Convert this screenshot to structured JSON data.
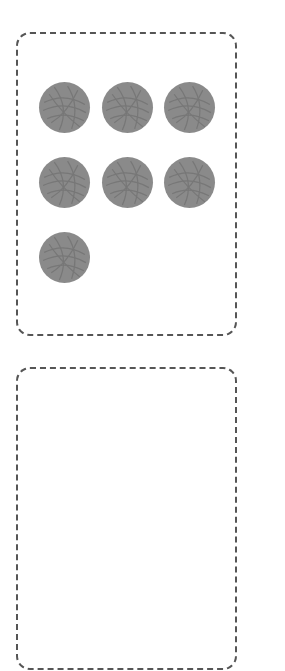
{
  "source_box": {
    "ball_count": 7,
    "balls": [
      {
        "x": 39,
        "y": 82
      },
      {
        "x": 102,
        "y": 82
      },
      {
        "x": 164,
        "y": 82
      },
      {
        "x": 39,
        "y": 157
      },
      {
        "x": 102,
        "y": 157
      },
      {
        "x": 164,
        "y": 157
      },
      {
        "x": 39,
        "y": 232
      }
    ]
  },
  "target_box": {
    "ball_count": 0
  },
  "colors": {
    "ball": "#8a8a8a",
    "border": "#555555"
  },
  "icons": {
    "ball": "yarn-ball-icon"
  }
}
